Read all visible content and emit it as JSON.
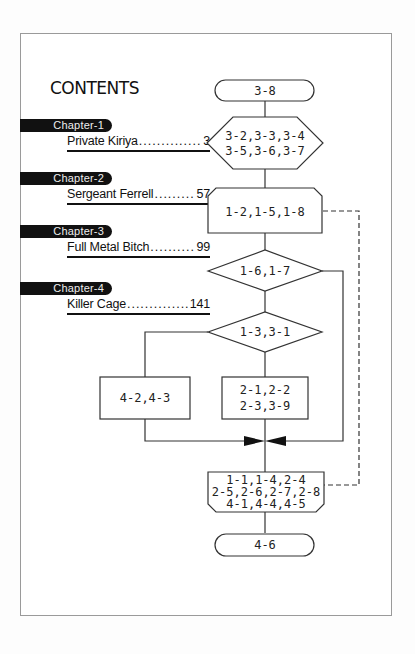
{
  "contents": {
    "title": "CONTENTS",
    "chapters": [
      {
        "label": "Chapter-1",
        "title": "Private Kiriya",
        "page": "3"
      },
      {
        "label": "Chapter-2",
        "title": "Sergeant Ferrell",
        "page": "57"
      },
      {
        "label": "Chapter-3",
        "title": "Full Metal Bitch",
        "page": "99"
      },
      {
        "label": "Chapter-4",
        "title": "Killer Cage",
        "page": "141"
      }
    ]
  },
  "flowchart": {
    "start": "3-8",
    "hexagon": [
      "3-2,3-3,3-4",
      "3-5,3-6,3-7"
    ],
    "loop_start": "1-2,1-5,1-8",
    "decision_1": "1-6,1-7",
    "decision_2": "1-3,3-1",
    "box_left": "4-2,4-3",
    "box_center": [
      "2-1,2-2",
      "2-3,3-9"
    ],
    "loop_end": [
      "1-1,1-4,2-4",
      "2-5,2-6,2-7,2-8",
      "4-1,4-4,4-5"
    ],
    "end": "4-6"
  },
  "colors": {
    "ink": "#111111",
    "line": "#333333",
    "frame": "#9a9a9a",
    "pill_text": "#eeeeee"
  }
}
